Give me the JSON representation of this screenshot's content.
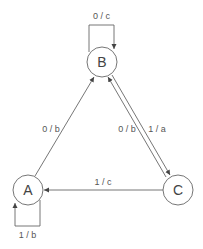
{
  "diagram": {
    "type": "state-machine",
    "states": [
      {
        "id": "A",
        "label": "A"
      },
      {
        "id": "B",
        "label": "B"
      },
      {
        "id": "C",
        "label": "C"
      }
    ],
    "transitions": [
      {
        "from": "B",
        "to": "B",
        "label": "0 / c"
      },
      {
        "from": "A",
        "to": "A",
        "label": "1 / b"
      },
      {
        "from": "A",
        "to": "B",
        "label": "0 / b"
      },
      {
        "from": "C",
        "to": "B",
        "label": "0 / b"
      },
      {
        "from": "B",
        "to": "C",
        "label": "1 / a"
      },
      {
        "from": "C",
        "to": "A",
        "label": "1 / c"
      }
    ],
    "colors": {
      "stroke": "#666666",
      "text": "#555555",
      "background": "#ffffff"
    }
  }
}
